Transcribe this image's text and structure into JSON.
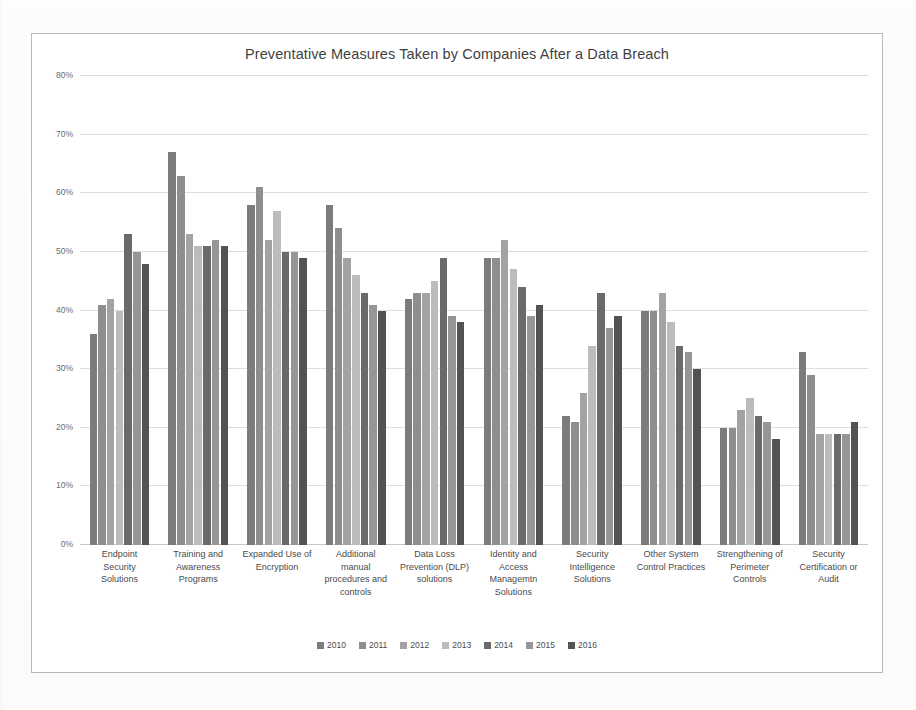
{
  "chart_data": {
    "type": "bar",
    "title": "Preventative Measures Taken by Companies After a Data Breach",
    "xlabel": "",
    "ylabel": "",
    "ylim": [
      0,
      80
    ],
    "ytick_labels": [
      "0%",
      "10%",
      "20%",
      "30%",
      "40%",
      "50%",
      "60%",
      "70%",
      "80%"
    ],
    "ytick_values": [
      0,
      10,
      20,
      30,
      40,
      50,
      60,
      70,
      80
    ],
    "grid": true,
    "legend_position": "bottom",
    "unit": "%",
    "categories": [
      "Endpoint Security Solutions",
      "Training and Awareness Programs",
      "Expanded Use of Encryption",
      "Additional manual procedures and controls",
      "Data Loss Prevention (DLP) solutions",
      "Identity and Access Managemtn Solutions",
      "Security Intelligence Solutions",
      "Other System Control Practices",
      "Strengthening of Perimeter Controls",
      "Security Certification or Audit"
    ],
    "series": [
      {
        "name": "2010",
        "color": "#7c7c7c",
        "values": [
          36,
          67,
          58,
          58,
          42,
          49,
          22,
          40,
          20,
          33
        ]
      },
      {
        "name": "2011",
        "color": "#8e8e8e",
        "values": [
          41,
          63,
          61,
          54,
          43,
          49,
          21,
          40,
          20,
          29
        ]
      },
      {
        "name": "2012",
        "color": "#a3a3a3",
        "values": [
          42,
          53,
          52,
          49,
          43,
          52,
          26,
          43,
          23,
          19
        ]
      },
      {
        "name": "2013",
        "color": "#bcbcbc",
        "values": [
          40,
          51,
          57,
          46,
          45,
          47,
          34,
          38,
          25,
          19
        ]
      },
      {
        "name": "2014",
        "color": "#6a6a6a",
        "values": [
          53,
          51,
          50,
          43,
          49,
          44,
          43,
          34,
          22,
          19
        ]
      },
      {
        "name": "2015",
        "color": "#969696",
        "values": [
          50,
          52,
          50,
          41,
          39,
          39,
          37,
          33,
          21,
          19
        ]
      },
      {
        "name": "2016",
        "color": "#535353",
        "values": [
          48,
          51,
          49,
          40,
          38,
          41,
          39,
          30,
          18,
          21
        ]
      }
    ]
  },
  "cat_lines": [
    [
      "Endpoint",
      "Security",
      "Solutions"
    ],
    [
      "Training and",
      "Awareness",
      "Programs"
    ],
    [
      "Expanded Use of",
      "Encryption"
    ],
    [
      "Additional",
      "manual",
      "procedures and",
      "controls"
    ],
    [
      "Data Loss",
      "Prevention (DLP)",
      "solutions"
    ],
    [
      "Identity and",
      "Access",
      "Managemtn",
      "Solutions"
    ],
    [
      "Security",
      "Intelligence",
      "Solutions"
    ],
    [
      "Other System",
      "Control Practices"
    ],
    [
      "Strengthening of",
      "Perimeter",
      "Controls"
    ],
    [
      "Security",
      "Certification or",
      "Audit"
    ]
  ]
}
